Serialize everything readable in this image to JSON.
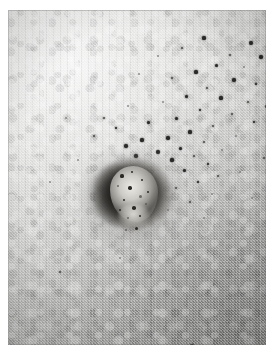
{
  "image": {
    "kind": "clinical-photograph",
    "rendering": "black-and-white / greyscale",
    "subject": "skin lesion",
    "caption": "",
    "title": "",
    "alt_text": "Greyscale clinical photograph of a crater-like skin ulcer surrounded by scattered punctate dark marks",
    "frame": {
      "border_color": "#ffffff",
      "border_left": 8,
      "border_top": 10,
      "border_right": 7,
      "border_bottom": 8
    },
    "plate": {
      "width": 258,
      "height": 335,
      "tone_light": "#d8d8d6",
      "tone_mid": "#c2c2c0",
      "tone_dark": "#a9a9a7",
      "grain": "film-grain"
    },
    "lesion": {
      "label": "",
      "center_x": 126,
      "center_y": 186,
      "rim_color": "#262523",
      "core_color": "#edece7",
      "halo_color": "#6a6864"
    },
    "spots": {
      "color": "#2a2a28",
      "soft_color": "#4e4e4b",
      "faint_color": "#6d6d6a",
      "points": [
        {
          "x": 196,
          "y": 28,
          "r": 1.6,
          "c": "dark"
        },
        {
          "x": 243,
          "y": 33,
          "r": 1.9,
          "c": "dark"
        },
        {
          "x": 222,
          "y": 45,
          "r": 1.4,
          "c": "soft"
        },
        {
          "x": 253,
          "y": 47,
          "r": 1.7,
          "c": "dark"
        },
        {
          "x": 174,
          "y": 38,
          "r": 1.3,
          "c": "soft"
        },
        {
          "x": 208,
          "y": 55,
          "r": 1.5,
          "c": "dark"
        },
        {
          "x": 236,
          "y": 57,
          "r": 1.2,
          "c": "faint"
        },
        {
          "x": 150,
          "y": 46,
          "r": 1.1,
          "c": "faint"
        },
        {
          "x": 188,
          "y": 62,
          "r": 1.6,
          "c": "dark"
        },
        {
          "x": 261,
          "y": 62,
          "r": 1.5,
          "c": "dark"
        },
        {
          "x": 164,
          "y": 68,
          "r": 1.3,
          "c": "soft"
        },
        {
          "x": 226,
          "y": 70,
          "r": 1.8,
          "c": "dark"
        },
        {
          "x": 248,
          "y": 74,
          "r": 1.4,
          "c": "dark"
        },
        {
          "x": 199,
          "y": 78,
          "r": 1.2,
          "c": "soft"
        },
        {
          "x": 131,
          "y": 64,
          "r": 1.2,
          "c": "faint"
        },
        {
          "x": 178,
          "y": 86,
          "r": 1.5,
          "c": "dark"
        },
        {
          "x": 213,
          "y": 88,
          "r": 1.6,
          "c": "dark"
        },
        {
          "x": 240,
          "y": 92,
          "r": 1.3,
          "c": "soft"
        },
        {
          "x": 258,
          "y": 96,
          "r": 1.5,
          "c": "dark"
        },
        {
          "x": 155,
          "y": 92,
          "r": 1.1,
          "c": "faint"
        },
        {
          "x": 192,
          "y": 100,
          "r": 1.4,
          "c": "dark"
        },
        {
          "x": 224,
          "y": 104,
          "r": 1.2,
          "c": "soft"
        },
        {
          "x": 120,
          "y": 96,
          "r": 1.2,
          "c": "faint"
        },
        {
          "x": 168,
          "y": 108,
          "r": 1.5,
          "c": "dark"
        },
        {
          "x": 246,
          "y": 112,
          "r": 1.3,
          "c": "dark"
        },
        {
          "x": 205,
          "y": 116,
          "r": 1.4,
          "c": "soft"
        },
        {
          "x": 140,
          "y": 112,
          "r": 1.5,
          "c": "dark"
        },
        {
          "x": 182,
          "y": 122,
          "r": 1.6,
          "c": "dark"
        },
        {
          "x": 228,
          "y": 126,
          "r": 1.2,
          "c": "faint"
        },
        {
          "x": 108,
          "y": 118,
          "r": 1.4,
          "c": "dark"
        },
        {
          "x": 160,
          "y": 128,
          "r": 1.7,
          "c": "dark"
        },
        {
          "x": 196,
          "y": 132,
          "r": 1.3,
          "c": "soft"
        },
        {
          "x": 134,
          "y": 130,
          "r": 1.6,
          "c": "dark"
        },
        {
          "x": 172,
          "y": 138,
          "r": 1.5,
          "c": "dark"
        },
        {
          "x": 214,
          "y": 140,
          "r": 1.2,
          "c": "faint"
        },
        {
          "x": 118,
          "y": 136,
          "r": 1.8,
          "c": "dark"
        },
        {
          "x": 150,
          "y": 142,
          "r": 1.9,
          "c": "dark"
        },
        {
          "x": 186,
          "y": 146,
          "r": 1.4,
          "c": "soft"
        },
        {
          "x": 128,
          "y": 146,
          "r": 1.7,
          "c": "dark"
        },
        {
          "x": 164,
          "y": 150,
          "r": 1.6,
          "c": "dark"
        },
        {
          "x": 200,
          "y": 154,
          "r": 1.3,
          "c": "dark"
        },
        {
          "x": 176,
          "y": 160,
          "r": 1.5,
          "c": "dark"
        },
        {
          "x": 210,
          "y": 166,
          "r": 1.2,
          "c": "soft"
        },
        {
          "x": 190,
          "y": 172,
          "r": 1.4,
          "c": "dark"
        },
        {
          "x": 168,
          "y": 178,
          "r": 1.3,
          "c": "soft"
        },
        {
          "x": 204,
          "y": 184,
          "r": 1.2,
          "c": "faint"
        },
        {
          "x": 182,
          "y": 192,
          "r": 1.3,
          "c": "soft"
        },
        {
          "x": 160,
          "y": 200,
          "r": 1.2,
          "c": "faint"
        },
        {
          "x": 196,
          "y": 208,
          "r": 1.1,
          "c": "faint"
        },
        {
          "x": 86,
          "y": 126,
          "r": 1.3,
          "c": "soft"
        },
        {
          "x": 70,
          "y": 150,
          "r": 1.2,
          "c": "faint"
        },
        {
          "x": 58,
          "y": 108,
          "r": 1.1,
          "c": "faint"
        },
        {
          "x": 42,
          "y": 172,
          "r": 1.2,
          "c": "faint"
        },
        {
          "x": 96,
          "y": 108,
          "r": 1.2,
          "c": "soft"
        },
        {
          "x": 184,
          "y": 336,
          "r": 1.9,
          "c": "dark"
        },
        {
          "x": 52,
          "y": 262,
          "r": 1.3,
          "c": "soft"
        },
        {
          "x": 244,
          "y": 188,
          "r": 1.2,
          "c": "faint"
        },
        {
          "x": 256,
          "y": 148,
          "r": 1.3,
          "c": "soft"
        },
        {
          "x": 232,
          "y": 162,
          "r": 1.1,
          "c": "faint"
        },
        {
          "x": 112,
          "y": 248,
          "r": 1.1,
          "c": "faint"
        },
        {
          "x": 206,
          "y": 274,
          "r": 1.0,
          "c": "faint"
        }
      ]
    },
    "core_specks": [
      {
        "x": 12,
        "y": 10,
        "r": 1.6
      },
      {
        "x": 22,
        "y": 6,
        "r": 1.3
      },
      {
        "x": 8,
        "y": 20,
        "r": 1.4
      },
      {
        "x": 20,
        "y": 22,
        "r": 1.7
      },
      {
        "x": 32,
        "y": 14,
        "r": 1.2
      },
      {
        "x": 30,
        "y": 30,
        "r": 1.5
      },
      {
        "x": 14,
        "y": 34,
        "r": 1.3
      },
      {
        "x": 24,
        "y": 42,
        "r": 1.8
      },
      {
        "x": 36,
        "y": 38,
        "r": 1.2
      },
      {
        "x": 10,
        "y": 44,
        "r": 1.2
      },
      {
        "x": 30,
        "y": 50,
        "r": 1.4
      },
      {
        "x": 18,
        "y": 52,
        "r": 1.1
      },
      {
        "x": 38,
        "y": 26,
        "r": 1.1
      },
      {
        "x": 26,
        "y": 62,
        "r": 1.5
      },
      {
        "x": 16,
        "y": 64,
        "r": 1.2
      }
    ]
  }
}
